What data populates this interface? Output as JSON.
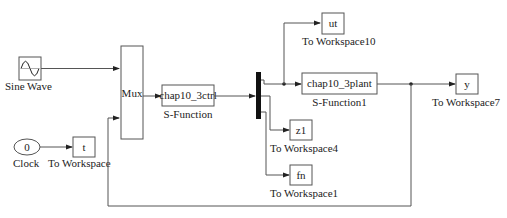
{
  "diagram": {
    "type": "simulink-block-diagram",
    "blocks": {
      "sine": {
        "label": "Sine Wave",
        "icon": "sine-wave-icon"
      },
      "clock": {
        "label": "Clock",
        "value": "0"
      },
      "to_ws_t": {
        "label": "To Workspace",
        "var": "t"
      },
      "mux": {
        "label": "Mux"
      },
      "ctrl": {
        "label": "S-Function",
        "name": "chap10_3ctrl"
      },
      "demux": {
        "label": "Demux"
      },
      "plant": {
        "label": "S-Function1",
        "name": "chap10_3plant"
      },
      "to_ws_ut": {
        "label": "To Workspace10",
        "var": "ut"
      },
      "to_ws_z1": {
        "label": "To Workspace4",
        "var": "z1"
      },
      "to_ws_fn": {
        "label": "To Workspace1",
        "var": "fn"
      },
      "to_ws_y": {
        "label": "To Workspace7",
        "var": "y"
      }
    },
    "connections": [
      {
        "from": "Sine Wave",
        "to": "Mux.in1"
      },
      {
        "from": "Clock",
        "to": "To Workspace (t)"
      },
      {
        "from": "Mux",
        "to": "chap10_3ctrl"
      },
      {
        "from": "chap10_3ctrl",
        "to": "Demux"
      },
      {
        "from": "Demux.out1",
        "to": "chap10_3plant"
      },
      {
        "from": "Demux.out1",
        "to": "To Workspace10 (ut)"
      },
      {
        "from": "Demux.out2",
        "to": "To Workspace4 (z1)"
      },
      {
        "from": "Demux.out3",
        "to": "To Workspace1 (fn)"
      },
      {
        "from": "chap10_3plant",
        "to": "To Workspace7 (y)"
      },
      {
        "from": "chap10_3plant",
        "to": "Mux.in2 (feedback)"
      }
    ]
  }
}
